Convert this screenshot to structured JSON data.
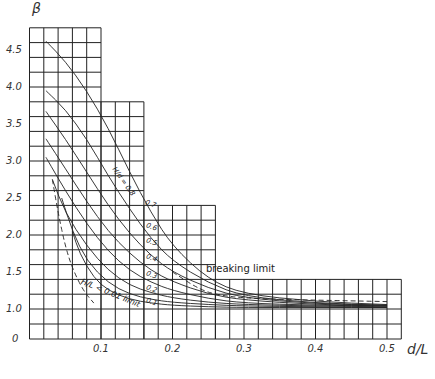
{
  "chart_data": {
    "type": "line",
    "title": "",
    "xlabel": "d/L",
    "ylabel": "β",
    "xlim": [
      0,
      0.52
    ],
    "ylim": [
      0,
      4.8
    ],
    "y_axis_break": "between 0 and 1.0",
    "grid": true,
    "grid_spacing": {
      "x": 0.02,
      "y": 0.2
    },
    "grid_steps": [
      {
        "x_to": 0.1,
        "y_top": 4.8
      },
      {
        "x_to": 0.16,
        "y_top": 3.8
      },
      {
        "x_to": 0.26,
        "y_top": 2.4
      },
      {
        "x_to": 0.52,
        "y_top": 1.4
      }
    ],
    "x_ticks": [
      "0.1",
      "0.2",
      "0.3",
      "0.4",
      "0.5"
    ],
    "y_ticks": [
      "0",
      "1.0",
      "1.5",
      "2.0",
      "2.5",
      "3.0",
      "3.5",
      "4.0",
      "4.5"
    ],
    "curve_family_label": "H/d = 0.8",
    "series": [
      {
        "name": "H/d = 0.8",
        "x": [
          0.023,
          0.05,
          0.08,
          0.11,
          0.14,
          0.17,
          0.2,
          0.25,
          0.3,
          0.4,
          0.5
        ],
        "y": [
          4.62,
          4.35,
          3.95,
          3.45,
          2.85,
          2.3,
          1.85,
          1.4,
          1.2,
          1.1,
          1.06
        ]
      },
      {
        "name": "0.7",
        "x": [
          0.023,
          0.05,
          0.08,
          0.11,
          0.14,
          0.17,
          0.2,
          0.25,
          0.3,
          0.4,
          0.5
        ],
        "y": [
          3.95,
          3.7,
          3.3,
          2.8,
          2.35,
          1.95,
          1.65,
          1.35,
          1.17,
          1.08,
          1.05
        ]
      },
      {
        "name": "0.6",
        "x": [
          0.023,
          0.05,
          0.08,
          0.11,
          0.14,
          0.17,
          0.2,
          0.25,
          0.3,
          0.4,
          0.5
        ],
        "y": [
          3.67,
          3.3,
          2.85,
          2.4,
          2.02,
          1.72,
          1.5,
          1.28,
          1.15,
          1.07,
          1.05
        ]
      },
      {
        "name": "0.5",
        "x": [
          0.023,
          0.05,
          0.08,
          0.11,
          0.14,
          0.17,
          0.2,
          0.25,
          0.3,
          0.4,
          0.5
        ],
        "y": [
          3.3,
          2.9,
          2.45,
          2.05,
          1.75,
          1.52,
          1.37,
          1.2,
          1.12,
          1.06,
          1.04
        ]
      },
      {
        "name": "0.4",
        "x": [
          0.023,
          0.05,
          0.08,
          0.11,
          0.14,
          0.17,
          0.2,
          0.25,
          0.3,
          0.4,
          0.5
        ],
        "y": [
          3.05,
          2.6,
          2.15,
          1.78,
          1.52,
          1.36,
          1.25,
          1.14,
          1.08,
          1.05,
          1.04
        ]
      },
      {
        "name": "0.3",
        "x": [
          0.032,
          0.05,
          0.08,
          0.11,
          0.14,
          0.17,
          0.2,
          0.25,
          0.3,
          0.4,
          0.5
        ],
        "y": [
          2.75,
          2.3,
          1.85,
          1.52,
          1.32,
          1.22,
          1.15,
          1.09,
          1.06,
          1.04,
          1.03
        ]
      },
      {
        "name": "0.2",
        "x": [
          0.045,
          0.06,
          0.08,
          0.11,
          0.14,
          0.17,
          0.2,
          0.25,
          0.3,
          0.4,
          0.5
        ],
        "y": [
          2.5,
          2.05,
          1.65,
          1.35,
          1.2,
          1.13,
          1.09,
          1.06,
          1.04,
          1.03,
          1.02
        ]
      },
      {
        "name": "0.1",
        "x": [
          0.06,
          0.07,
          0.09,
          0.11,
          0.14,
          0.17,
          0.2,
          0.25,
          0.3,
          0.4,
          0.5
        ],
        "y": [
          2.05,
          1.75,
          1.42,
          1.25,
          1.13,
          1.08,
          1.05,
          1.03,
          1.02,
          1.02,
          1.02
        ]
      }
    ],
    "limit_lines": [
      {
        "name": "H/L < 0.01 limit",
        "style": "dashed",
        "x": [
          0.032,
          0.04,
          0.05,
          0.06,
          0.075,
          0.09
        ],
        "y": [
          2.75,
          2.3,
          1.85,
          1.55,
          1.25,
          1.08
        ]
      },
      {
        "name": "breaking limit",
        "style": "dashed",
        "x": [
          0.2,
          0.24,
          0.27,
          0.3,
          0.35,
          0.4,
          0.45,
          0.5
        ],
        "y": [
          1.5,
          1.25,
          1.18,
          1.15,
          1.13,
          1.12,
          1.11,
          1.1
        ]
      }
    ],
    "annotations": [
      "H/d = 0.8",
      "0.7",
      "0.6",
      "0.5",
      "0.4",
      "0.3",
      "0.2",
      "0.1",
      "H/L < 0.01 limit",
      "breaking limit"
    ]
  },
  "labels": {
    "y_axis": "β",
    "x_axis": "d/L",
    "y_ticks": [
      {
        "text": "4.5",
        "value": 4.5
      },
      {
        "text": "4.0",
        "value": 4.0
      },
      {
        "text": "3.5",
        "value": 3.5
      },
      {
        "text": "3.0",
        "value": 3.0
      },
      {
        "text": "2.5",
        "value": 2.5
      },
      {
        "text": "2.0",
        "value": 2.0
      },
      {
        "text": "1.5",
        "value": 1.5
      },
      {
        "text": "1.0",
        "value": 1.0
      },
      {
        "text": "0",
        "value": 0
      }
    ],
    "x_ticks": [
      {
        "text": "0.1",
        "value": 0.1
      },
      {
        "text": "0.2",
        "value": 0.2
      },
      {
        "text": "0.3",
        "value": 0.3
      },
      {
        "text": "0.4",
        "value": 0.4
      },
      {
        "text": "0.5",
        "value": 0.5
      }
    ],
    "family": "H/d = 0.8",
    "curve_values": [
      "0.7",
      "0.6",
      "0.5",
      "0.4",
      "0.3",
      "0.2",
      "0.1"
    ],
    "ratio_limit": "H/L < 0.01 limit",
    "breaking_limit": "breaking limit"
  }
}
